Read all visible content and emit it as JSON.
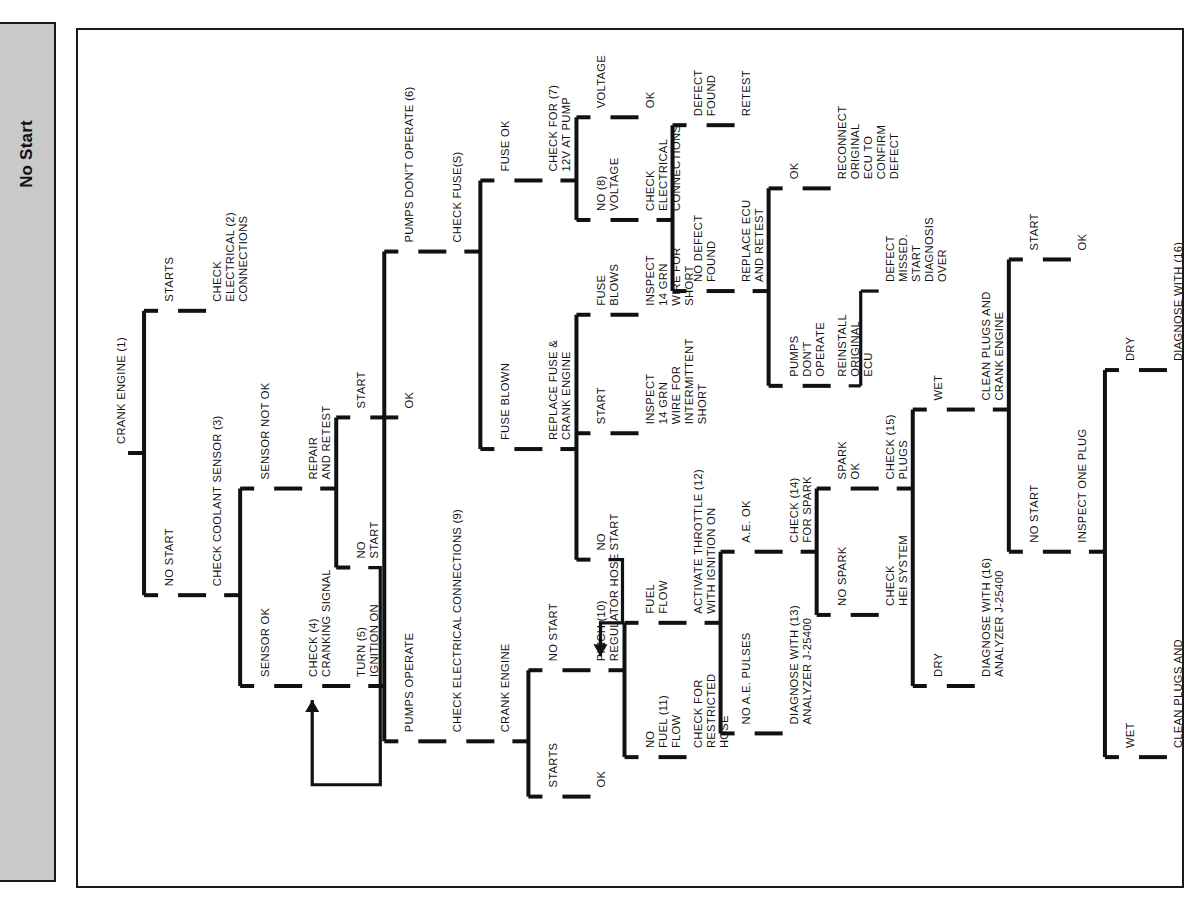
{
  "sidebar": {
    "label": "No Start"
  },
  "diagram": {
    "title": "No Start",
    "orientation": "rotated-90",
    "nodes": [
      {
        "id": "crank_engine_1",
        "label": "CRANK ENGINE (1)",
        "col": 0,
        "pos": 0.5
      },
      {
        "id": "starts",
        "label": "STARTS",
        "col": 1,
        "pos": 0.32
      },
      {
        "id": "no_start_1",
        "label": "NO START",
        "col": 1,
        "pos": 0.68
      },
      {
        "id": "check_elec_2",
        "label": "CHECK\nELECTRICAL (2)\nCONNECTIONS",
        "col": 2,
        "pos": 0.32
      },
      {
        "id": "check_coolant_3",
        "label": "CHECK COOLANT SENSOR (3)",
        "col": 2,
        "pos": 0.68
      },
      {
        "id": "sensor_not_ok",
        "label": "SENSOR NOT OK",
        "col": 3,
        "pos": 0.545
      },
      {
        "id": "sensor_ok",
        "label": "SENSOR OK",
        "col": 3,
        "pos": 0.795
      },
      {
        "id": "repair_retest",
        "label": "REPAIR\nAND RETEST",
        "col": 4,
        "pos": 0.545
      },
      {
        "id": "start_ok_a",
        "label": "START",
        "col": 5,
        "pos": 0.455
      },
      {
        "id": "no_start_2",
        "label": "NO\nSTART",
        "col": 5,
        "pos": 0.645
      },
      {
        "id": "ok_a",
        "label": "OK",
        "col": 6,
        "pos": 0.455
      },
      {
        "id": "check_cranking_4",
        "label": "CHECK (4)\nCRANKING SIGNAL",
        "col": 4,
        "pos": 0.795
      },
      {
        "id": "turn_ignition_5",
        "label": "TURN (5)\nIGNITION ON",
        "col": 5,
        "pos": 0.795
      },
      {
        "id": "pumps_dont_op_6",
        "label": "PUMPS DON'T OPERATE (6)",
        "col": 6,
        "pos": 0.245
      },
      {
        "id": "pumps_operate",
        "label": "PUMPS OPERATE",
        "col": 6,
        "pos": 0.865
      },
      {
        "id": "check_fuses",
        "label": "CHECK FUSE(S)",
        "col": 7,
        "pos": 0.245
      },
      {
        "id": "fuse_ok",
        "label": "FUSE OK",
        "col": 8,
        "pos": 0.155
      },
      {
        "id": "fuse_blown",
        "label": "FUSE BLOWN",
        "col": 8,
        "pos": 0.495
      },
      {
        "id": "check_12v_7",
        "label": "CHECK FOR (7)\n12V AT PUMP",
        "col": 9,
        "pos": 0.155
      },
      {
        "id": "voltage_ok",
        "label": "VOLTAGE",
        "col": 10,
        "pos": 0.075
      },
      {
        "id": "ok_volt",
        "label": "OK",
        "col": 11,
        "pos": 0.075
      },
      {
        "id": "no_voltage_8",
        "label": "NO (8)\nVOLTAGE",
        "col": 10,
        "pos": 0.205
      },
      {
        "id": "check_elec_conn",
        "label": "CHECK\nELECTRICAL\nCONNECTIONS",
        "col": 11,
        "pos": 0.205
      },
      {
        "id": "defect_found",
        "label": "DEFECT\nFOUND",
        "col": 12,
        "pos": 0.085
      },
      {
        "id": "retest",
        "label": "RETEST",
        "col": 13,
        "pos": 0.085
      },
      {
        "id": "no_defect_found",
        "label": "NO DEFECT\nFOUND",
        "col": 12,
        "pos": 0.295
      },
      {
        "id": "replace_ecu_retest",
        "label": "REPLACE ECU\nAND RETEST",
        "col": 13,
        "pos": 0.295
      },
      {
        "id": "ok_b",
        "label": "OK",
        "col": 14,
        "pos": 0.165
      },
      {
        "id": "reconnect_orig",
        "label": "RECONNECT\nORIGINAL\nECU TO\nCONFIRM\nDEFECT",
        "col": 15,
        "pos": 0.165
      },
      {
        "id": "pumps_dont_op_b",
        "label": "PUMPS\nDON'T\nOPERATE",
        "col": 14,
        "pos": 0.415
      },
      {
        "id": "reinstall_orig_ecu",
        "label": "REINSTALL\nORIGINAL\nECU",
        "col": 15,
        "pos": 0.415
      },
      {
        "id": "defect_missed",
        "label": "DEFECT\nMISSED.\nSTART\nDIAGNOSIS\nOVER",
        "col": 16,
        "pos": 0.295
      },
      {
        "id": "replace_fuse_crank",
        "label": "REPLACE FUSE &\nCRANK ENGINE",
        "col": 9,
        "pos": 0.495
      },
      {
        "id": "fuse_blows",
        "label": "FUSE\nBLOWS",
        "col": 10,
        "pos": 0.325
      },
      {
        "id": "inspect_14grn_short",
        "label": "INSPECT\n14 GRN\nWIRE FOR\nSHORT",
        "col": 11,
        "pos": 0.325
      },
      {
        "id": "start_b",
        "label": "START",
        "col": 10,
        "pos": 0.475
      },
      {
        "id": "inspect_14grn_inter",
        "label": "INSPECT\n14 GRN\nWIRE FOR\nINTERMITTENT\nSHORT",
        "col": 11,
        "pos": 0.475
      },
      {
        "id": "no_start_3",
        "label": "NO\nSTART",
        "col": 10,
        "pos": 0.635
      },
      {
        "id": "check_elec_conn_9",
        "label": "CHECK ELECTRICAL CONNECTIONS (9)",
        "col": 7,
        "pos": 0.865
      },
      {
        "id": "crank_engine_b",
        "label": "CRANK ENGINE",
        "col": 8,
        "pos": 0.865
      },
      {
        "id": "starts_b",
        "label": "STARTS",
        "col": 9,
        "pos": 0.935
      },
      {
        "id": "ok_c",
        "label": "OK",
        "col": 10,
        "pos": 0.935
      },
      {
        "id": "no_start_4",
        "label": "NO START",
        "col": 9,
        "pos": 0.775
      },
      {
        "id": "pinch_regulator_10",
        "label": "PINCH (10)\nREGULATOR HOSE",
        "col": 10,
        "pos": 0.775
      },
      {
        "id": "fuel_flow",
        "label": "FUEL\nFLOW",
        "col": 11,
        "pos": 0.715
      },
      {
        "id": "no_fuel_flow_11",
        "label": "NO\nFUEL (11)\nFLOW",
        "col": 11,
        "pos": 0.885
      },
      {
        "id": "check_restricted",
        "label": "CHECK FOR\nRESTRICTED\nHOSE",
        "col": 12,
        "pos": 0.885
      },
      {
        "id": "activate_throttle_12",
        "label": "ACTIVATE THROTTLE (12)\nWITH IGNITION ON",
        "col": 12,
        "pos": 0.715
      },
      {
        "id": "ae_ok",
        "label": "A.E. OK",
        "col": 13,
        "pos": 0.625
      },
      {
        "id": "no_ae_pulses",
        "label": "NO A.E. PULSES",
        "col": 13,
        "pos": 0.855
      },
      {
        "id": "diagnose_13",
        "label": "DIAGNOSE WITH (13)\nANALYZER J-25400",
        "col": 14,
        "pos": 0.855
      },
      {
        "id": "check_spark_14",
        "label": "CHECK (14)\nFOR SPARK",
        "col": 14,
        "pos": 0.625
      },
      {
        "id": "spark_ok",
        "label": "SPARK\nOK",
        "col": 15,
        "pos": 0.545
      },
      {
        "id": "no_spark",
        "label": "NO SPARK",
        "col": 15,
        "pos": 0.705
      },
      {
        "id": "check_hei",
        "label": "CHECK\nHEI SYSTEM",
        "col": 16,
        "pos": 0.705
      },
      {
        "id": "check_plugs_15",
        "label": "CHECK (15)\nPLUGS",
        "col": 16,
        "pos": 0.545
      },
      {
        "id": "wet_a",
        "label": "WET",
        "col": 17,
        "pos": 0.445
      },
      {
        "id": "dry_a",
        "label": "DRY",
        "col": 17,
        "pos": 0.795
      },
      {
        "id": "diagnose_16_a",
        "label": "DIAGNOSE WITH (16)\nANALYZER J-25400",
        "col": 18,
        "pos": 0.795
      },
      {
        "id": "clean_plugs_crank",
        "label": "CLEAN PLUGS AND\nCRANK ENGINE",
        "col": 18,
        "pos": 0.445
      },
      {
        "id": "start_c",
        "label": "START",
        "col": 19,
        "pos": 0.255
      },
      {
        "id": "ok_d",
        "label": "OK",
        "col": 20,
        "pos": 0.255
      },
      {
        "id": "no_start_5",
        "label": "NO START",
        "col": 19,
        "pos": 0.625
      },
      {
        "id": "inspect_one_plug",
        "label": "INSPECT ONE PLUG",
        "col": 20,
        "pos": 0.625
      },
      {
        "id": "dry_b",
        "label": "DRY",
        "col": 21,
        "pos": 0.395
      },
      {
        "id": "diagnose_16_b",
        "label": "DIAGNOSE WITH (16)\nANALYZER J-25400",
        "col": 22,
        "pos": 0.395
      },
      {
        "id": "wet_b",
        "label": "WET",
        "col": 21,
        "pos": 0.885
      },
      {
        "id": "clean_plugs_diag_16",
        "label": "CLEAN PLUGS AND\nDIAGNOSE WITH (16)\nANALYZER J-25400",
        "col": 22,
        "pos": 0.885
      }
    ],
    "edge_count": 66
  }
}
